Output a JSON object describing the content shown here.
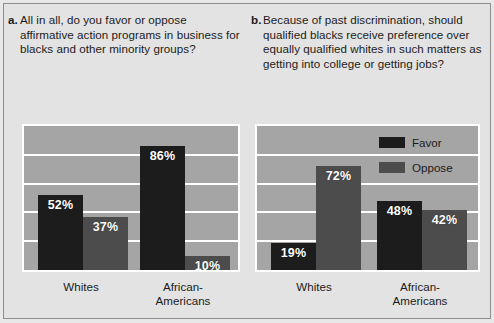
{
  "figure": {
    "background": "#e3e3e3",
    "plot_background": "#a5a5a5",
    "gridline_color": "#ffffff"
  },
  "panels": [
    {
      "marker": "a.",
      "question": "All in all, do you favor or oppose affirmative action programs in business for blacks and other minority groups?"
    },
    {
      "marker": "b.",
      "question": "Because of past discrimination, should qualified blacks receive preference over equally qualified whites in such matters as getting into college or getting jobs?"
    }
  ],
  "legend": {
    "items": [
      {
        "label": "Favor",
        "color": "#1c1c1c"
      },
      {
        "label": "Oppose",
        "color": "#4c4c4c"
      }
    ]
  },
  "chart_data": [
    {
      "type": "bar",
      "title": "All in all, do you favor or oppose affirmative action programs in business for blacks and other minority groups?",
      "panel": "a",
      "categories": [
        "Whites",
        "African-Americans"
      ],
      "category_lines": [
        [
          "Whites"
        ],
        [
          "African-",
          "Americans"
        ]
      ],
      "series": [
        {
          "name": "Favor",
          "color": "#1c1c1c",
          "values": [
            52,
            86
          ],
          "labels": [
            "52%",
            "86%"
          ]
        },
        {
          "name": "Oppose",
          "color": "#4c4c4c",
          "values": [
            37,
            10
          ],
          "labels": [
            "37%",
            "10%"
          ]
        }
      ],
      "ylim": [
        0,
        100
      ],
      "yticks": [
        0,
        20,
        40,
        60,
        80,
        100
      ],
      "ylabel": "",
      "xlabel": "",
      "grid": true,
      "legend_position": "none"
    },
    {
      "type": "bar",
      "title": "Because of past discrimination, should qualified blacks receive preference over equally qualified whites in such matters as getting into college or getting jobs?",
      "panel": "b",
      "categories": [
        "Whites",
        "African-Americans"
      ],
      "category_lines": [
        [
          "Whites"
        ],
        [
          "African-",
          "Americans"
        ]
      ],
      "series": [
        {
          "name": "Favor",
          "color": "#1c1c1c",
          "values": [
            19,
            48
          ],
          "labels": [
            "19%",
            "48%"
          ]
        },
        {
          "name": "Oppose",
          "color": "#4c4c4c",
          "values": [
            72,
            42
          ],
          "labels": [
            "72%",
            "42%"
          ]
        }
      ],
      "ylim": [
        0,
        100
      ],
      "yticks": [
        0,
        20,
        40,
        60,
        80,
        100
      ],
      "ylabel": "",
      "xlabel": "",
      "grid": true,
      "legend_position": "top-right-inside"
    }
  ]
}
